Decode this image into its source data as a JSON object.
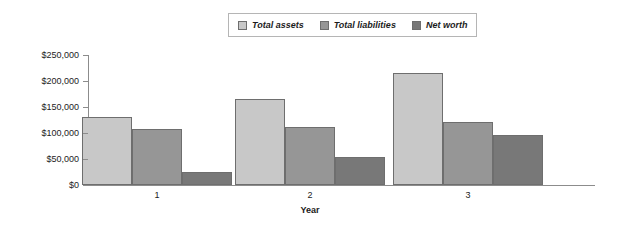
{
  "chart_data": {
    "type": "bar",
    "title": "",
    "xlabel": "Year",
    "ylabel": "",
    "categories": [
      "1",
      "2",
      "3"
    ],
    "series": [
      {
        "name": "Total assets",
        "color": "#c8c8c8",
        "values": [
          131000,
          166000,
          215000
        ]
      },
      {
        "name": "Total liabilities",
        "color": "#969696",
        "values": [
          108000,
          112000,
          121000
        ]
      },
      {
        "name": "Net worth",
        "color": "#787878",
        "values": [
          25000,
          54000,
          96000
        ]
      }
    ],
    "ylim": [
      0,
      250000
    ],
    "ytick_values": [
      250000,
      200000,
      150000,
      100000,
      50000,
      0
    ],
    "ytick_labels": [
      "$250,000",
      "$200,000",
      "$150,000",
      "$100,000",
      "$50,000",
      "$0"
    ],
    "grid": false,
    "legend_position": "top-center",
    "axis_color": "#8c8c8c",
    "bar_border_color": "#6e6e6e"
  },
  "legend": {
    "entries": [
      {
        "label": "Total assets"
      },
      {
        "label": "Total liabilities"
      },
      {
        "label": "Net worth"
      }
    ]
  },
  "axes": {
    "x_title": "Year"
  }
}
